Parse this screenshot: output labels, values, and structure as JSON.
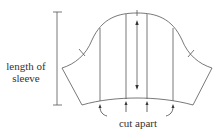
{
  "diagram": {
    "labels": {
      "length_line1": "length of",
      "length_line2": "sleeve",
      "cut": "cut apart"
    },
    "stroke_color": "#555555",
    "slash_line_count": 4,
    "grainline_arrow": "double-headed vertical arrow at center"
  }
}
